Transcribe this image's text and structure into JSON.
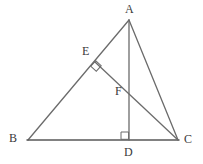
{
  "figure": {
    "canvas": {
      "width": 203,
      "height": 164,
      "background": "#ffffff"
    },
    "stroke_color": "#6b6b6b",
    "stroke_color_dark": "#585858",
    "stroke_width": 1.3,
    "label_color": "#3a3a3a",
    "label_font_size": 12,
    "points": [
      {
        "id": "A",
        "label": "A",
        "x": 129,
        "y": 20,
        "label_x": 125,
        "label_y": 3
      },
      {
        "id": "B",
        "label": "B",
        "x": 28,
        "y": 140,
        "label_x": 9,
        "label_y": 132
      },
      {
        "id": "C",
        "label": "C",
        "x": 178,
        "y": 140,
        "label_x": 184,
        "label_y": 133
      },
      {
        "id": "D",
        "label": "D",
        "x": 129,
        "y": 140,
        "label_x": 124,
        "label_y": 146
      },
      {
        "id": "E",
        "label": "E",
        "x": 95,
        "y": 62,
        "label_x": 82,
        "label_y": 45
      },
      {
        "id": "F",
        "label": "F",
        "x": 129,
        "y": 96,
        "label_x": 115,
        "label_y": 85
      }
    ],
    "segments": [
      {
        "id": "AB",
        "from": "A",
        "to": "B",
        "x1": 129,
        "y1": 20,
        "x2": 28,
        "y2": 140
      },
      {
        "id": "BC",
        "from": "B",
        "to": "C",
        "x1": 28,
        "y1": 140,
        "x2": 178,
        "y2": 140
      },
      {
        "id": "AC",
        "from": "A",
        "to": "C",
        "x1": 129,
        "y1": 20,
        "x2": 178,
        "y2": 140
      },
      {
        "id": "AD",
        "from": "A",
        "to": "D",
        "x1": 129,
        "y1": 20,
        "x2": 129,
        "y2": 140
      },
      {
        "id": "EC",
        "from": "E",
        "to": "C",
        "x1": 95,
        "y1": 62,
        "x2": 178,
        "y2": 140
      }
    ],
    "right_angles": [
      {
        "id": "angle-at-E",
        "at": "E",
        "marker": "diamond",
        "cx": 96,
        "cy": 66,
        "size": 5,
        "rotation": 42
      },
      {
        "id": "angle-at-D",
        "at": "D",
        "marker": "square",
        "x": 121,
        "y": 132,
        "size": 8
      }
    ]
  }
}
